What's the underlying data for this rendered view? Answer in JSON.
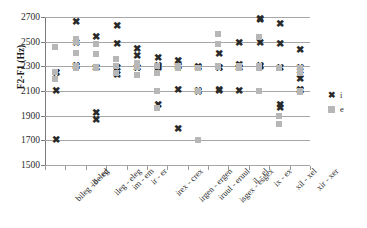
{
  "chart_data": {
    "type": "scatter",
    "title": "",
    "xlabel": "",
    "ylabel": "F2-F1 (Hz)",
    "ylim": [
      1500,
      2700
    ],
    "y_ticks": [
      2700,
      2500,
      2300,
      2100,
      1900,
      1700,
      1500
    ],
    "grid": true,
    "legend_position": "right",
    "legend": [
      {
        "name": "i",
        "marker": "cross-x",
        "color": "#2a2a2a"
      },
      {
        "name": "e",
        "marker": "square",
        "color": "#b7b7b7"
      }
    ],
    "categories": [
      "bileg - beleg",
      "id - ed",
      "ileg - eleg",
      "im - em",
      "ir - er",
      "irex - crex",
      "irgen - ergen",
      "iruul - eruul",
      "isgex - esgex",
      "il - el",
      "ix - ex",
      "xil - xel",
      "xir - xer"
    ],
    "series": [
      {
        "name": "i",
        "marker": "cross-x",
        "color": "#2a2a2a",
        "points": [
          {
            "category_index": 0,
            "values": [
              2250,
              2245,
              2100,
              1700
            ]
          },
          {
            "category_index": 1,
            "values": [
              2660,
              2490,
              2300,
              2295
            ]
          },
          {
            "category_index": 2,
            "values": [
              2540,
              2290,
              2285,
              1925,
              1865
            ]
          },
          {
            "category_index": 3,
            "values": [
              2630,
              2480,
              2290,
              2230
            ]
          },
          {
            "category_index": 4,
            "values": [
              2440,
              2380,
              2290,
              2285
            ]
          },
          {
            "category_index": 5,
            "values": [
              2370,
              2300,
              2295,
              2290,
              1990
            ]
          },
          {
            "category_index": 6,
            "values": [
              2340,
              2300,
              2295,
              2110,
              1790
            ]
          },
          {
            "category_index": 7,
            "values": [
              2295,
              2290,
              2100,
              2095
            ]
          },
          {
            "category_index": 8,
            "values": [
              2400,
              2290,
              2285,
              2105,
              2100
            ]
          },
          {
            "category_index": 9,
            "values": [
              2490,
              2310,
              2290,
              2285,
              2100
            ]
          },
          {
            "category_index": 10,
            "values": [
              2680,
              2675,
              2490,
              2300,
              2295
            ]
          },
          {
            "category_index": 11,
            "values": [
              2640,
              2480,
              2290,
              1990,
              1960
            ]
          },
          {
            "category_index": 12,
            "values": [
              2430,
              2290,
              2230,
              2200,
              2110,
              2100
            ]
          }
        ]
      },
      {
        "name": "e",
        "marker": "square",
        "color": "#b7b7b7",
        "points": [
          {
            "category_index": 0,
            "values": [
              2460,
              2255,
              2200
            ]
          },
          {
            "category_index": 1,
            "values": [
              2520,
              2500,
              2410,
              2300,
              2290
            ]
          },
          {
            "category_index": 2,
            "values": [
              2480,
              2400,
              2295,
              2285
            ]
          },
          {
            "category_index": 3,
            "values": [
              2360,
              2300,
              2250
            ]
          },
          {
            "category_index": 4,
            "values": [
              2330,
              2300,
              2295,
              2230
            ]
          },
          {
            "category_index": 5,
            "values": [
              2300,
              2250,
              2100,
              1960
            ]
          },
          {
            "category_index": 6,
            "values": [
              2300,
              2295,
              2290
            ]
          },
          {
            "category_index": 7,
            "values": [
              2290,
              2100,
              1700
            ]
          },
          {
            "category_index": 8,
            "values": [
              2560,
              2480,
              2300,
              2295
            ]
          },
          {
            "category_index": 9,
            "values": [
              2300,
              2290,
              2285
            ]
          },
          {
            "category_index": 10,
            "values": [
              2540,
              2300,
              2285,
              2100
            ]
          },
          {
            "category_index": 11,
            "values": [
              2290,
              1900,
              1830
            ]
          },
          {
            "category_index": 12,
            "values": [
              2290,
              2245,
              2100,
              2090
            ]
          }
        ]
      }
    ]
  }
}
